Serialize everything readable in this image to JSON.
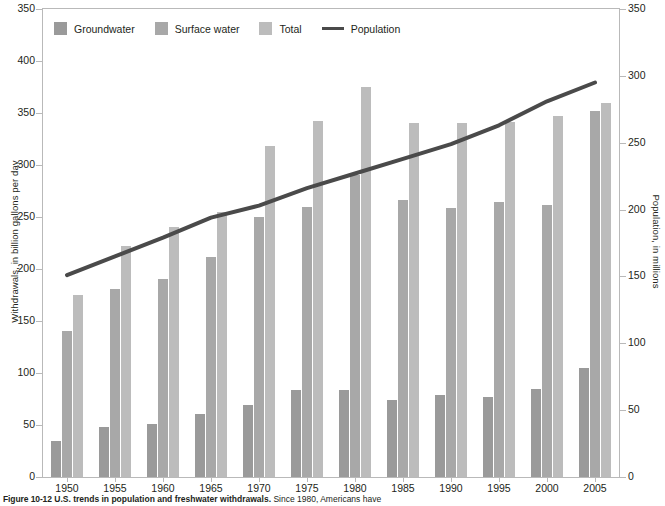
{
  "figure": {
    "number": "Figure 10-12",
    "title": "U.S. trends in population and freshwater withdrawals.",
    "body": "Since 1980, Americans have"
  },
  "legend": {
    "position": "top-left",
    "items": [
      {
        "label": "Groundwater",
        "swatch": "dark-gray-square",
        "color": "#9a9a9a"
      },
      {
        "label": "Surface water",
        "swatch": "medium-gray-square",
        "color": "#a8a8a8"
      },
      {
        "label": "Total",
        "swatch": "light-gray-square",
        "color": "#bcbcbc"
      },
      {
        "label": "Population",
        "swatch": "dark-line",
        "color": "#4a4a4a"
      }
    ]
  },
  "chart_data": {
    "type": "bar",
    "title": "",
    "xlabel": "",
    "ylabel": "Withdrawals, in billion gallons per day",
    "y2label": "Population, in millions",
    "grid": false,
    "categories": [
      "1950",
      "1955",
      "1960",
      "1965",
      "1970",
      "1975",
      "1980",
      "1985",
      "1990",
      "1995",
      "2000",
      "2005"
    ],
    "ylim": [
      0,
      450
    ],
    "y2lim": [
      0,
      350
    ],
    "yticks_left": [
      "0",
      "50",
      "100",
      "150",
      "200",
      "250",
      "300",
      "350",
      "400",
      "350"
    ],
    "yticks_right": [
      "0",
      "50",
      "100",
      "150",
      "200",
      "250",
      "300",
      "350"
    ],
    "series": [
      {
        "name": "Groundwater",
        "axis": "left",
        "units": "billion gallons per day",
        "color": "#9a9a9a",
        "values": [
          35,
          48,
          51,
          61,
          69,
          84,
          84,
          74,
          79,
          77,
          85,
          105
        ]
      },
      {
        "name": "Surface water",
        "axis": "left",
        "units": "billion gallons per day",
        "color": "#a8a8a8",
        "values": [
          140,
          181,
          190,
          212,
          250,
          260,
          290,
          266,
          259,
          264,
          262,
          352
        ]
      },
      {
        "name": "Total",
        "axis": "left",
        "units": "billion gallons per day",
        "color": "#bcbcbc",
        "values": [
          175,
          222,
          240,
          255,
          318,
          342,
          375,
          340,
          340,
          341,
          347,
          360
        ]
      },
      {
        "name": "Population",
        "axis": "right",
        "units": "millions",
        "color": "#4a4a4a",
        "values": [
          151,
          165,
          179,
          194,
          203,
          216,
          227,
          238,
          249,
          263,
          281,
          295
        ]
      }
    ]
  }
}
